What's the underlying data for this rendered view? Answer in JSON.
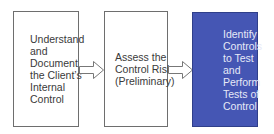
{
  "diagram": {
    "steps": [
      {
        "label": "Understand and Document the Client’s Internal Control",
        "lines": [
          "Understand",
          "and",
          "Document",
          "the Client’s",
          "Internal",
          "Control"
        ]
      },
      {
        "label": "Assess the Control Risk (Preliminary)",
        "lines": [
          "Assess the",
          "Control Risk",
          "(Preliminary)"
        ]
      },
      {
        "label": "Identify Controls to Test and Perform Tests of Control",
        "lines": [
          "Identify",
          "Controls",
          "to Test",
          "and",
          "Perform",
          "Tests of",
          "Control"
        ]
      }
    ],
    "connectors": [
      "right-arrow",
      "right-arrow"
    ],
    "colors": {
      "highlight_fill": "#4556b4",
      "border": "#6e6e6e",
      "text": "#3a3a3a",
      "highlight_text": "#e6e9f7"
    }
  }
}
